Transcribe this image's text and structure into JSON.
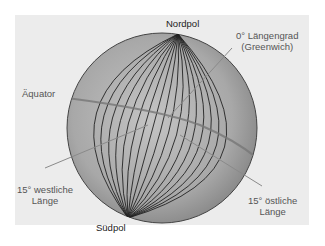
{
  "diagram": {
    "type": "globe-longitude",
    "labels": {
      "north_pole": "Nordpol",
      "south_pole": "Südpol",
      "equator": "Äquator",
      "prime_meridian_line1": "0° Längengrad",
      "prime_meridian_line2": "(Greenwich)",
      "west_line1": "15° westliche",
      "west_line2": "Länge",
      "east_line1": "15° östliche",
      "east_line2": "Länge"
    },
    "colors": {
      "background": "#ffffff",
      "panel": "#ececec",
      "globe_fill_center": "#bdbdbd",
      "globe_fill_edge": "#8a8a8a",
      "meridian_stroke": "#222222",
      "equator_stroke": "#7a7a7a",
      "leader_stroke": "#8a8a8a"
    },
    "meridian_count": 17
  }
}
